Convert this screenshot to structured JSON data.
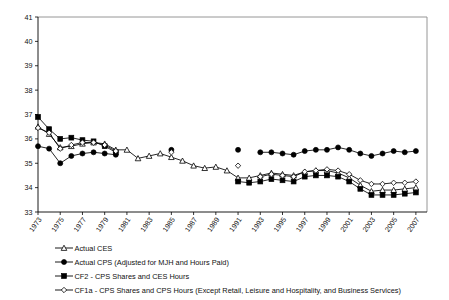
{
  "chart_data": {
    "type": "line",
    "title": "",
    "subtitle": "",
    "xlabel": "",
    "ylabel": "",
    "xlim": [
      1973,
      2008
    ],
    "ylim": [
      33,
      41
    ],
    "ytick_labels": [
      "33",
      "34",
      "35",
      "36",
      "37",
      "38",
      "39",
      "40",
      "41"
    ],
    "ytick_values": [
      33,
      34,
      35,
      36,
      37,
      38,
      39,
      40,
      41
    ],
    "xtick_labels": [
      "1973",
      "1975",
      "1977",
      "1979",
      "1981",
      "1983",
      "1985",
      "1987",
      "1989",
      "1991",
      "1993",
      "1995",
      "1997",
      "1999",
      "2001",
      "2003",
      "2005",
      "2007"
    ],
    "xtick_values": [
      1973,
      1975,
      1977,
      1979,
      1981,
      1983,
      1985,
      1987,
      1989,
      1991,
      1993,
      1995,
      1997,
      1999,
      2001,
      2003,
      2005,
      2007
    ],
    "grid": false,
    "legend_position": "below",
    "series": [
      {
        "name": "Actual CES",
        "legend_label": "Actual CES",
        "marker": "open-triangle",
        "color": "#000000",
        "x": [
          1973,
          1974,
          1975,
          1976,
          1977,
          1978,
          1979,
          1980,
          1981,
          1982,
          1983,
          1984,
          1985,
          1986,
          1987,
          1988,
          1989,
          1990,
          1991,
          1992,
          1993,
          1994,
          1995,
          1996,
          1997,
          1998,
          1999,
          2000,
          2001,
          2002,
          2003,
          2004,
          2005,
          2006,
          2007
        ],
        "values": [
          36.5,
          36.2,
          35.65,
          35.7,
          35.8,
          35.85,
          35.8,
          35.55,
          35.55,
          35.2,
          35.3,
          35.4,
          35.25,
          35.1,
          34.9,
          34.8,
          34.85,
          34.7,
          34.4,
          34.4,
          34.5,
          34.6,
          34.55,
          34.5,
          34.65,
          34.7,
          34.7,
          34.6,
          34.4,
          34.1,
          33.85,
          33.9,
          33.9,
          33.95,
          34.0
        ]
      },
      {
        "name": "Actual CPS (Adjusted for MJH and Hours Paid)",
        "legend_label": "Actual CPS (Adjusted for MJH and Hours Paid)",
        "marker": "filled-circle",
        "color": "#000000",
        "segments": [
          {
            "x": [
              1973,
              1974,
              1975,
              1976,
              1977,
              1978,
              1979,
              1980
            ],
            "values": [
              35.7,
              35.6,
              35.0,
              35.3,
              35.4,
              35.45,
              35.4,
              35.35
            ]
          },
          {
            "x": [
              1985
            ],
            "values": [
              35.55
            ]
          },
          {
            "x": [
              1991
            ],
            "values": [
              35.55
            ]
          },
          {
            "x": [
              1993,
              1994,
              1995,
              1996,
              1997,
              1998,
              1999,
              2000,
              2001,
              2002,
              2003,
              2004,
              2005,
              2006,
              2007
            ],
            "values": [
              35.45,
              35.45,
              35.4,
              35.35,
              35.5,
              35.55,
              35.55,
              35.65,
              35.55,
              35.4,
              35.3,
              35.4,
              35.5,
              35.45,
              35.5
            ]
          }
        ]
      },
      {
        "name": "CF2 - CPS Shares and CES Hours",
        "legend_label": "CF2 - CPS Shares and CES Hours",
        "marker": "filled-square",
        "color": "#000000",
        "segments": [
          {
            "x": [
              1973,
              1974,
              1975,
              1976,
              1977,
              1978,
              1979,
              1980
            ],
            "values": [
              36.9,
              36.4,
              36.0,
              36.05,
              35.95,
              35.9,
              35.7,
              35.45
            ]
          },
          {
            "x": [
              1991,
              1992,
              1993,
              1994,
              1995,
              1996,
              1997,
              1998,
              1999,
              2000,
              2001,
              2002,
              2003,
              2004,
              2005,
              2006,
              2007
            ],
            "values": [
              34.25,
              34.2,
              34.25,
              34.35,
              34.3,
              34.25,
              34.45,
              34.5,
              34.5,
              34.45,
              34.25,
              33.95,
              33.7,
              33.7,
              33.7,
              33.75,
              33.8
            ]
          }
        ]
      },
      {
        "name": "CF1a - CPS Shares and CPS Hours (Except Retail, Leisure and Hospitality, and Business Services)",
        "legend_label": "CF1a - CPS Shares and CPS Hours (Except Retail, Leisure and Hospitality, and Business Services)",
        "marker": "open-diamond",
        "color": "#000000",
        "segments": [
          {
            "x": [
              1973,
              1974,
              1975,
              1976,
              1977,
              1978,
              1979,
              1980
            ],
            "values": [
              36.45,
              36.25,
              35.6,
              35.75,
              35.85,
              35.85,
              35.75,
              35.5
            ]
          },
          {
            "x": [
              1985
            ],
            "values": [
              35.45
            ]
          },
          {
            "x": [
              1991
            ],
            "values": [
              34.9
            ]
          },
          {
            "x": [
              1993,
              1994,
              1995,
              1996,
              1997,
              1998,
              1999,
              2000,
              2001,
              2002,
              2003,
              2004,
              2005,
              2006,
              2007
            ],
            "values": [
              34.45,
              34.55,
              34.5,
              34.45,
              34.65,
              34.7,
              34.75,
              34.7,
              34.55,
              34.3,
              34.15,
              34.15,
              34.2,
              34.2,
              34.25
            ]
          }
        ]
      }
    ]
  },
  "legend": {
    "items": [
      {
        "label": "Actual CES",
        "marker": "open-triangle"
      },
      {
        "label": "Actual CPS (Adjusted for MJH and Hours Paid)",
        "marker": "filled-circle"
      },
      {
        "label": "CF2 - CPS Shares and CES Hours",
        "marker": "filled-square"
      },
      {
        "label": "CF1a - CPS Shares and CPS Hours (Except Retail, Leisure and Hospitality, and Business Services)",
        "marker": "open-diamond"
      }
    ]
  }
}
